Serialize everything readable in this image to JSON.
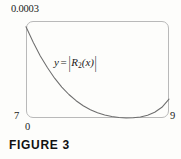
{
  "figure": {
    "caption": "FIGURE 3",
    "equation_parts": {
      "y": "y",
      "equals": "=",
      "open_bar": "|",
      "R": "R",
      "subscript": "2",
      "arg": "(x)",
      "close_bar": "|"
    },
    "equation_plain": "y = |R₂(x)|"
  },
  "axes": {
    "y_max_label": "0.0003",
    "y_min_label": "7",
    "x_min_label": "0",
    "x_max_label": "9"
  },
  "colors": {
    "background": "#fdfdfb",
    "frame": "#b9b9b9",
    "curve": "#6e6e6e",
    "text": "#1a1a1a",
    "caption": "#111111"
  },
  "chart_data": {
    "type": "line",
    "title": "",
    "subtitle": "",
    "xlabel": "",
    "ylabel": "",
    "xlim": [
      7,
      9
    ],
    "ylim": [
      0,
      0.0003
    ],
    "grid": false,
    "legend": null,
    "annotations": [
      {
        "text": "y = |R₂(x)|",
        "x": 7.45,
        "y": 0.000195
      }
    ],
    "tick_labels": {
      "x": [
        "7",
        "9"
      ],
      "y": [
        "0",
        "0.0003"
      ]
    },
    "series": [
      {
        "name": "y = |R2(x)|",
        "x": [
          7.0,
          7.1,
          7.2,
          7.3,
          7.4,
          7.5,
          7.6,
          7.7,
          7.8,
          7.9,
          8.0,
          8.1,
          8.2,
          8.3,
          8.4,
          8.5,
          8.6,
          8.7,
          8.8,
          8.9,
          9.0
        ],
        "y": [
          0.000282,
          0.000234,
          0.000192,
          0.000155,
          0.000123,
          9.55e-05,
          7.25e-05,
          5.35e-05,
          3.8e-05,
          2.55e-05,
          1.6e-05,
          9e-06,
          4.2e-06,
          1.4e-06,
          2e-07,
          6e-07,
          3e-06,
          8.2e-06,
          1.75e-05,
          3.3e-05,
          5.85e-05
        ],
        "x_px": [
          0,
          7.2,
          14.3,
          21.5,
          28.6,
          35.8,
          42.9,
          50.1,
          57.2,
          64.4,
          71.5,
          78.7,
          85.8,
          93.0,
          100.1,
          107.3,
          114.4,
          121.6,
          128.7,
          135.9,
          143.0
        ],
        "y_px_from_bottom": [
          91.3,
          75.7,
          62.1,
          50.2,
          39.8,
          30.9,
          23.5,
          17.3,
          12.3,
          8.3,
          5.2,
          2.9,
          1.4,
          0.5,
          0.1,
          0.2,
          1.0,
          2.7,
          5.7,
          10.7,
          18.9
        ]
      }
    ]
  }
}
